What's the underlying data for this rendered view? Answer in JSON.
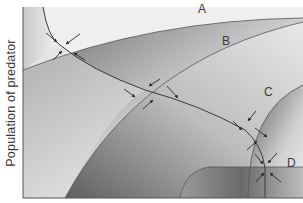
{
  "figure": {
    "y_axis_label": "Population of predator",
    "x_axis_label": "",
    "curve_labels": {
      "A": "A",
      "B": "B",
      "C": "C",
      "D": "D"
    },
    "equilibrium_points": [
      {
        "id": "eq-A",
        "description": "intersection of prey isocline with curve A",
        "arrows": 4
      },
      {
        "id": "eq-B",
        "description": "intersection of prey isocline with curve B",
        "arrows": 4
      },
      {
        "id": "eq-C",
        "description": "intersection of prey isocline with curve C",
        "arrows": 4
      },
      {
        "id": "eq-D",
        "description": "intersection of prey isocline with curve D",
        "arrows": 4
      }
    ],
    "colors": {
      "background": "#ffffff",
      "light_fill": "#e6e6e6",
      "dark_fill": "#6e6e6e",
      "curve_stroke": "#4a4a4a",
      "axis": "#555555",
      "arrow": "#2a2a2a"
    }
  }
}
